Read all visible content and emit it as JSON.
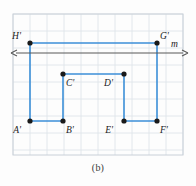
{
  "figure": {
    "caption": "(b)",
    "line_label": "m",
    "colors": {
      "shape_stroke": "#3c8fd8",
      "point_fill": "#1a1a1a",
      "grid_line": "#dfe4ea",
      "grid_border": "#c9d0d8",
      "axis_line": "#585858",
      "background": "#fdfdfd",
      "label_text": "#1b1b1b"
    },
    "grid": {
      "x_min": 13,
      "x_max": 183,
      "y_min": 14,
      "y_max": 155,
      "cell_size": 17,
      "columns": 10,
      "rows": 8.3
    },
    "line_m": {
      "y": 53,
      "x_start": 11,
      "x_end": 188,
      "arrow_both_ends": true,
      "label": "m",
      "label_x": 171,
      "label_y": 47
    },
    "points": [
      {
        "name": "A'",
        "x": 30,
        "y": 121,
        "label_dx": -9,
        "label_dy": 12
      },
      {
        "name": "B'",
        "x": 63,
        "y": 121,
        "label_dx": 3,
        "label_dy": 12
      },
      {
        "name": "C'",
        "x": 63,
        "y": 74,
        "label_dx": 3,
        "label_dy": 12
      },
      {
        "name": "D'",
        "x": 124,
        "y": 74,
        "label_dx": -11,
        "label_dy": 12
      },
      {
        "name": "E'",
        "x": 124,
        "y": 121,
        "label_dx": -11,
        "label_dy": 12
      },
      {
        "name": "F'",
        "x": 157,
        "y": 121,
        "label_dx": 3,
        "label_dy": 12
      },
      {
        "name": "G'",
        "x": 157,
        "y": 43,
        "label_dx": 3,
        "label_dy": -4
      },
      {
        "name": "H'",
        "x": 30,
        "y": 43,
        "label_dx": -9,
        "label_dy": -4
      }
    ],
    "shape_path": "A'-B'-C'-D'-E'-F'-G'-H'-A'",
    "point_radius": 2.6,
    "stroke_width": 1.6
  }
}
